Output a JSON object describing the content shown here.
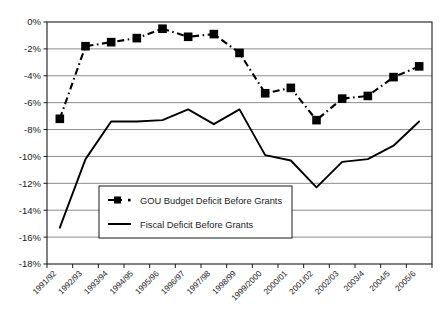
{
  "chart_data": {
    "type": "line",
    "title": "",
    "subtitle": "",
    "xlabel": "",
    "ylabel": "",
    "categories": [
      "1991/92",
      "1992/93",
      "1993/94",
      "1994/95",
      "1995/96",
      "1996/97",
      "1997/98",
      "1998/99",
      "1999/2000",
      "2000/01",
      "2001/02",
      "2002/03",
      "2003/4",
      "2004/5",
      "2005/6"
    ],
    "ylim": [
      -18,
      0
    ],
    "yticks": [
      0,
      -2,
      -4,
      -6,
      -8,
      -10,
      -12,
      -14,
      -16,
      -18
    ],
    "ytick_labels": [
      "0%",
      "-2%",
      "-4%",
      "-6%",
      "-8%",
      "-10%",
      "-12%",
      "-14%",
      "-16%",
      "-18%"
    ],
    "grid": "horizontal",
    "legend_position": "inside-lower-left",
    "series": [
      {
        "name": "GOU Budget Deficit Before Grants",
        "style": "dashed-with-square-markers",
        "color": "#000000",
        "values": [
          -7.2,
          -1.8,
          -1.5,
          -1.2,
          -0.5,
          -1.1,
          -0.9,
          -2.3,
          -5.3,
          -4.9,
          -7.3,
          -5.7,
          -5.5,
          -4.1,
          -3.3
        ]
      },
      {
        "name": "Fiscal Deficit Before Grants",
        "style": "solid",
        "color": "#000000",
        "values": [
          -15.3,
          -10.2,
          -7.4,
          -7.4,
          -7.3,
          -6.5,
          -7.6,
          -6.5,
          -9.9,
          -10.3,
          -12.3,
          -10.4,
          -10.2,
          -9.2,
          -7.4
        ]
      }
    ]
  },
  "legend": {
    "items": [
      {
        "label": "GOU Budget Deficit Before Grants",
        "marker": "dashed-square-marker"
      },
      {
        "label": "Fiscal Deficit Before Grants",
        "marker": "solid-line-marker"
      }
    ]
  },
  "colors": {
    "series": "#000000",
    "gridline": "#8c8c8c",
    "axis": "#1a1a1a",
    "plot_background": "#ffffff"
  }
}
